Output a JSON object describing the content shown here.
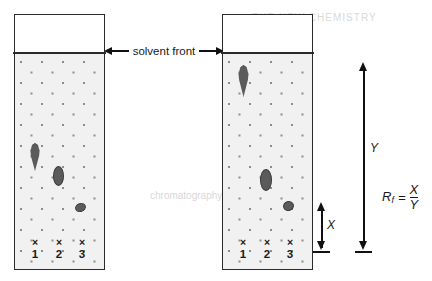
{
  "diagram": {
    "solvent_front_label": "solvent front",
    "measurement_x_label": "X",
    "measurement_y_label": "Y",
    "formula": {
      "symbol": "R",
      "subscript": "f",
      "equals": "=",
      "numerator": "X",
      "denominator": "Y"
    }
  },
  "plates": [
    {
      "name": "left-plate",
      "lanes": [
        {
          "mark": "×",
          "number": "1",
          "spot_shape": "teardrop"
        },
        {
          "mark": "×",
          "number": "2",
          "spot_shape": "oval"
        },
        {
          "mark": "×",
          "number": "3",
          "spot_shape": "round"
        }
      ]
    },
    {
      "name": "right-plate",
      "lanes": [
        {
          "mark": "×",
          "number": "1",
          "spot_shape": "teardrop"
        },
        {
          "mark": "×",
          "number": "2",
          "spot_shape": "oval"
        },
        {
          "mark": "×",
          "number": "3",
          "spot_shape": "round"
        }
      ]
    }
  ],
  "colors": {
    "plate_border": "#2b2b2b",
    "sorbent_fill": "#f1f1f1",
    "dot_texture": "#8d8d8d",
    "spot_fill": "#5b5b5b",
    "spot_outline": "#3a3a3a",
    "arrow": "#111111"
  },
  "bleed_text": {
    "line1": "THE NEW CHEMISTRY",
    "line2": "chromatography"
  }
}
